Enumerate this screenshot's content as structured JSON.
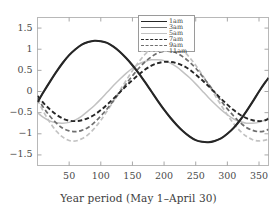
{
  "chart_data": {
    "type": "line",
    "title": "",
    "xlabel": "Year period  (May 1–April 30)",
    "ylabel": "",
    "xlim": [
      0,
      365
    ],
    "ylim": [
      -1.75,
      1.75
    ],
    "xticks": [
      50,
      100,
      150,
      200,
      250,
      300,
      350
    ],
    "yticks": [
      -1.5,
      -1,
      -0.5,
      0,
      0.5,
      1,
      1.5
    ],
    "xtick_labels": [
      "50",
      "100",
      "150",
      "200",
      "250",
      "300",
      "350"
    ],
    "ytick_labels": [
      "−1.5",
      "−1",
      "−0.5",
      "0",
      "0.5",
      "1",
      "1.5"
    ],
    "grid": false,
    "legend_position": "top-center",
    "x": [
      0,
      10,
      20,
      30,
      40,
      50,
      60,
      70,
      80,
      90,
      100,
      110,
      120,
      130,
      140,
      150,
      160,
      170,
      180,
      190,
      200,
      210,
      220,
      230,
      240,
      250,
      260,
      270,
      280,
      290,
      300,
      310,
      320,
      330,
      340,
      350,
      360,
      365
    ],
    "series": [
      {
        "name": "1am",
        "label": "1am",
        "color": "#262626",
        "style": "solid",
        "width": 2.1,
        "amplitude": 1.2,
        "phase_deg": 78,
        "offset": 0,
        "values": [
          -0.25,
          0.0,
          0.24,
          0.47,
          0.68,
          0.86,
          1.0,
          1.11,
          1.17,
          1.2,
          1.19,
          1.15,
          1.06,
          0.94,
          0.79,
          0.62,
          0.43,
          0.22,
          0.0,
          -0.22,
          -0.43,
          -0.62,
          -0.79,
          -0.94,
          -1.06,
          -1.15,
          -1.19,
          -1.2,
          -1.17,
          -1.11,
          -1.0,
          -0.86,
          -0.68,
          -0.47,
          -0.24,
          0.0,
          0.22,
          0.32
        ]
      },
      {
        "name": "3am",
        "label": "3am",
        "color": "#6e6e6e",
        "style": "solid",
        "width": 1.5,
        "amplitude": 1.2,
        "phase_deg": 78,
        "offset": 0,
        "values": [
          -0.25,
          0.0,
          0.24,
          0.47,
          0.68,
          0.86,
          1.0,
          1.11,
          1.17,
          1.2,
          1.19,
          1.15,
          1.06,
          0.94,
          0.79,
          0.62,
          0.43,
          0.22,
          0.0,
          -0.22,
          -0.43,
          -0.62,
          -0.79,
          -0.94,
          -1.06,
          -1.15,
          -1.19,
          -1.2,
          -1.17,
          -1.11,
          -1.0,
          -0.86,
          -0.68,
          -0.47,
          -0.24,
          0.0,
          0.22,
          0.32
        ]
      },
      {
        "name": "5am",
        "label": "5am",
        "color": "#c2c2c2",
        "style": "solid",
        "width": 1.5,
        "amplitude": 0.75,
        "phase_deg": 250,
        "offset": 0,
        "values": [
          -0.5,
          -0.62,
          -0.7,
          -0.74,
          -0.75,
          -0.73,
          -0.67,
          -0.58,
          -0.46,
          -0.33,
          -0.18,
          -0.02,
          0.14,
          0.29,
          0.43,
          0.55,
          0.65,
          0.71,
          0.75,
          0.75,
          0.73,
          0.67,
          0.58,
          0.46,
          0.33,
          0.18,
          0.02,
          -0.14,
          -0.29,
          -0.43,
          -0.55,
          -0.65,
          -0.71,
          -0.75,
          -0.75,
          -0.73,
          -0.67,
          -0.62
        ]
      },
      {
        "name": "7am",
        "label": "7am",
        "color": "#262626",
        "style": "dashed",
        "width": 1.9,
        "amplitude": 0.7,
        "phase_deg": 186,
        "offset": 0,
        "values": [
          -0.1,
          -0.28,
          -0.43,
          -0.55,
          -0.64,
          -0.69,
          -0.7,
          -0.68,
          -0.63,
          -0.55,
          -0.44,
          -0.31,
          -0.17,
          -0.02,
          0.13,
          0.27,
          0.4,
          0.52,
          0.61,
          0.67,
          0.7,
          0.7,
          0.67,
          0.61,
          0.52,
          0.4,
          0.27,
          0.13,
          -0.02,
          -0.17,
          -0.31,
          -0.44,
          -0.55,
          -0.63,
          -0.68,
          -0.7,
          -0.68,
          -0.64
        ]
      },
      {
        "name": "9am",
        "label": "9am",
        "color": "#6e6e6e",
        "style": "dashed",
        "width": 1.7,
        "amplitude": 0.95,
        "phase_deg": 192,
        "offset": 0,
        "values": [
          -0.15,
          -0.39,
          -0.59,
          -0.75,
          -0.87,
          -0.93,
          -0.95,
          -0.92,
          -0.85,
          -0.73,
          -0.58,
          -0.41,
          -0.22,
          -0.02,
          0.18,
          0.37,
          0.55,
          0.7,
          0.82,
          0.91,
          0.95,
          0.95,
          0.91,
          0.82,
          0.7,
          0.55,
          0.37,
          0.18,
          -0.02,
          -0.22,
          -0.41,
          -0.58,
          -0.73,
          -0.85,
          -0.92,
          -0.95,
          -0.93,
          -0.89
        ]
      },
      {
        "name": "11am",
        "label": "11am",
        "color": "#c2c2c2",
        "style": "dashed",
        "width": 1.7,
        "amplitude": 1.17,
        "phase_deg": 197,
        "offset": 0,
        "values": [
          -0.2,
          -0.49,
          -0.74,
          -0.94,
          -1.08,
          -1.16,
          -1.17,
          -1.12,
          -1.02,
          -0.87,
          -0.68,
          -0.46,
          -0.23,
          0.02,
          0.26,
          0.49,
          0.7,
          0.88,
          1.02,
          1.12,
          1.17,
          1.16,
          1.09,
          0.97,
          0.81,
          0.62,
          0.4,
          0.17,
          -0.08,
          -0.32,
          -0.55,
          -0.76,
          -0.93,
          -1.06,
          -1.14,
          -1.17,
          -1.15,
          -1.12
        ]
      }
    ]
  },
  "legend": {
    "items": [
      {
        "label": "1am"
      },
      {
        "label": "3am"
      },
      {
        "label": "5am"
      },
      {
        "label": "7am"
      },
      {
        "label": "9am"
      },
      {
        "label": "11am"
      }
    ]
  },
  "axes": {
    "xlabel": "Year period  (May 1–April 30)"
  }
}
